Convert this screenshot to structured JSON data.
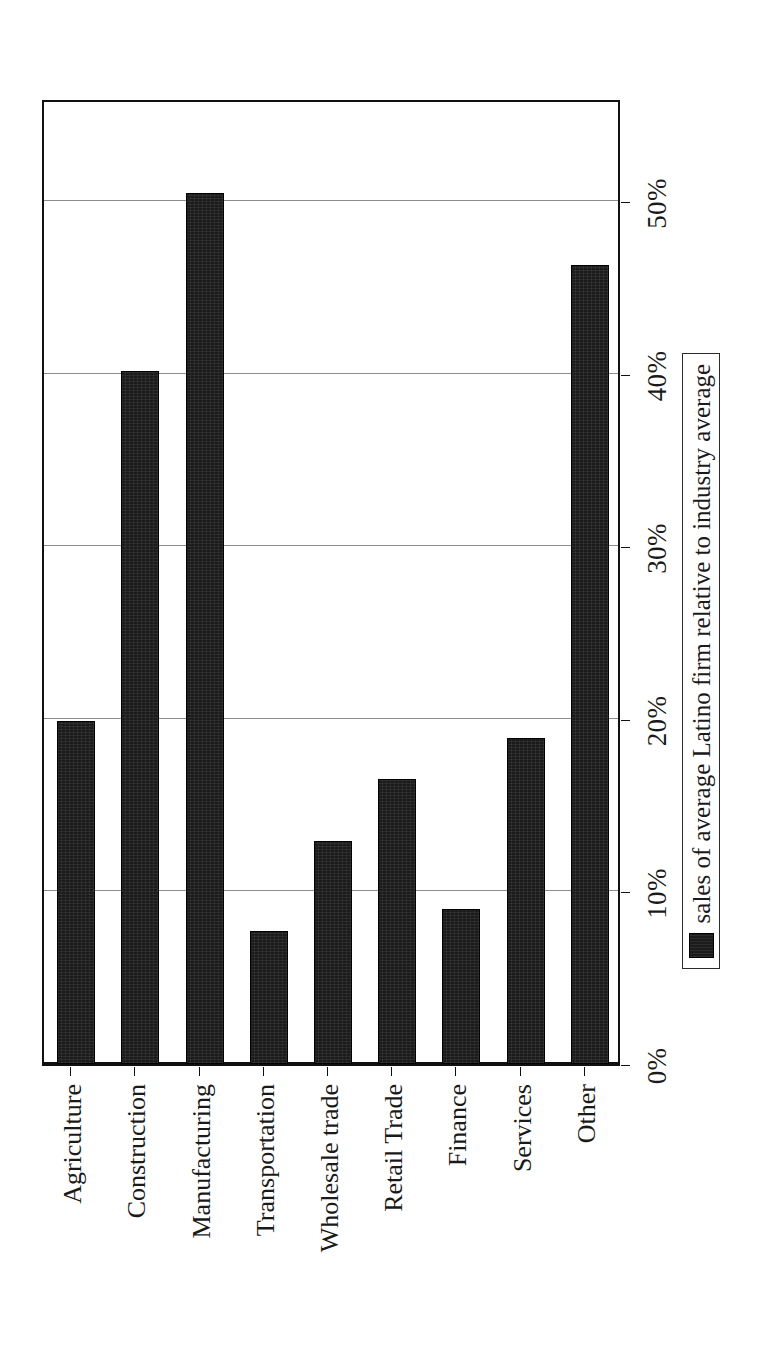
{
  "chart_data": {
    "type": "bar",
    "title": "",
    "subtitle": "",
    "xlabel": "",
    "ylabel": "",
    "orientation": "vertical",
    "rotated_on_page_degrees": 90,
    "categories": [
      "Agriculture",
      "Construction",
      "Manufacturing",
      "Transportation",
      "Wholesale trade",
      "Retail Trade",
      "Finance",
      "Services",
      "Other"
    ],
    "series": [
      {
        "name": "sales of average Latino firm relative to industry average",
        "values": [
          19.9,
          40.2,
          50.5,
          7.7,
          12.9,
          16.5,
          9.0,
          18.9,
          46.3
        ],
        "color": "#1b1b1b"
      }
    ],
    "value_axis": {
      "min": 0,
      "max": 56,
      "tick_values": [
        0,
        10,
        20,
        30,
        40,
        50
      ],
      "tick_labels": [
        "0%",
        "10%",
        "20%",
        "30%",
        "40%",
        "50%"
      ],
      "unit": "%"
    },
    "grid": {
      "value_axis_gridlines": true,
      "category_axis_gridlines": false,
      "gridline_color": "#8d8d8d"
    },
    "legend": {
      "position": "right",
      "bordered": true,
      "entries": [
        {
          "label": "sales of average Latino firm relative to industry average",
          "swatch_color": "#1b1b1b"
        }
      ]
    },
    "frame": {
      "border_color": "#111111",
      "background": "#ffffff"
    }
  }
}
